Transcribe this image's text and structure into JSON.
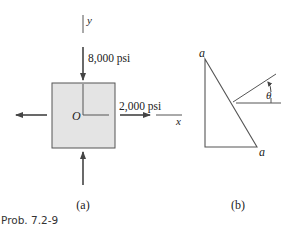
{
  "figure_a": {
    "y_axis_label": "y",
    "x_axis_label": "x",
    "origin_label": "O",
    "vertical_stress": "8,000 psi",
    "horizontal_stress": "2,000 psi",
    "caption": "(a)",
    "element_fill": "#e4e4e4"
  },
  "figure_b": {
    "top_vertex_label": "a",
    "bottom_vertex_label": "a",
    "angle_label": "θ",
    "caption": "(b)"
  },
  "problem_label": "Prob. 7.2-9"
}
